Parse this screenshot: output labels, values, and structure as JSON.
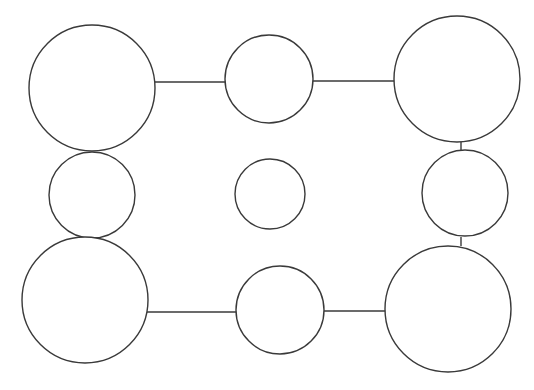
{
  "diagram": {
    "type": "node-graph",
    "background": "#ffffff",
    "stroke_color": "#3a3a3a",
    "nodes": [
      {
        "id": "top-left",
        "cx": 92,
        "cy": 88,
        "r": 63
      },
      {
        "id": "top-middle",
        "cx": 269,
        "cy": 79,
        "r": 44
      },
      {
        "id": "top-right",
        "cx": 457,
        "cy": 79,
        "r": 63
      },
      {
        "id": "middle-left",
        "cx": 92,
        "cy": 195,
        "r": 43
      },
      {
        "id": "center",
        "cx": 270,
        "cy": 194,
        "r": 35
      },
      {
        "id": "middle-right",
        "cx": 465,
        "cy": 193,
        "r": 43
      },
      {
        "id": "bottom-left",
        "cx": 85,
        "cy": 300,
        "r": 63
      },
      {
        "id": "bottom-middle",
        "cx": 280,
        "cy": 310,
        "r": 44
      },
      {
        "id": "bottom-right",
        "cx": 448,
        "cy": 309,
        "r": 63
      }
    ],
    "edges": [
      {
        "from": "top-left",
        "to": "top-middle",
        "x1": 155,
        "y1": 82,
        "x2": 226,
        "y2": 82
      },
      {
        "from": "top-middle",
        "to": "top-right",
        "x1": 313,
        "y1": 81,
        "x2": 395,
        "y2": 81
      },
      {
        "from": "top-right",
        "to": "middle-right",
        "x1": 461,
        "y1": 142,
        "x2": 461,
        "y2": 150
      },
      {
        "from": "middle-right",
        "to": "bottom-right",
        "x1": 461,
        "y1": 237,
        "x2": 461,
        "y2": 246
      },
      {
        "from": "bottom-left",
        "to": "bottom-middle",
        "x1": 147,
        "y1": 312,
        "x2": 238,
        "y2": 312
      },
      {
        "from": "bottom-middle",
        "to": "bottom-right",
        "x1": 324,
        "y1": 311,
        "x2": 386,
        "y2": 311
      }
    ]
  }
}
